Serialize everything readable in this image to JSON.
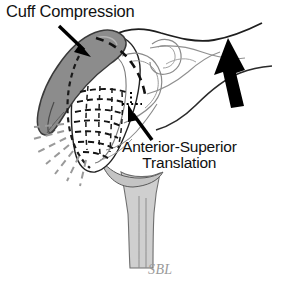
{
  "figure": {
    "background_color": "#ffffff",
    "width": 281,
    "height": 286
  },
  "labels": {
    "cuff_compression": "Cuff Compression",
    "anterior_superior_line1": "Anterior-Superior",
    "anterior_superior_line2": "Translation"
  },
  "signature": {
    "text": "SBL",
    "color": "#9a9a9a"
  },
  "annotations": {
    "cuff_arrow": "arrow-pointing-down-right-to-cuff",
    "translation_arrow": "arrow-pointing-up-left-to-humeral-head",
    "superior_force_arrow": "large-arrow-pointing-up-right",
    "radiating_lines": "pain-impingement-rays",
    "dotted_marker": "translation-target-marker"
  },
  "colors": {
    "outline": "#1a1a1a",
    "soft_outline": "#6b6b6b",
    "cuff_fill": "#8c8c8c",
    "cuff_stroke": "#3a3a3a",
    "bone_fill": "#ffffff",
    "shaft_fill": "#cfcfcf",
    "ray_color": "#9a9a9a",
    "arrow_fill": "#000000"
  },
  "anatomy": {
    "cuff": "rotator-cuff-compressed",
    "humeral_head": "humeral-head",
    "humeral_shaft": "humeral-shaft",
    "glenoid": "glenoid-fossa",
    "acromion": "acromion",
    "scapula": "scapula-body",
    "coracoid": "coracoid-process"
  }
}
